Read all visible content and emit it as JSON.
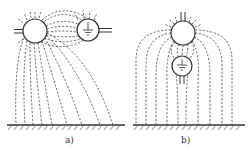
{
  "figure": {
    "panels": [
      {
        "label": "a)",
        "description": "Horizontal arrangement: energized conductor (left) beside grounded conductor (right) above earth plane; dashed field lines",
        "energized_conductor": {
          "cx": 35,
          "cy": 31,
          "r": 12
        },
        "grounded_conductor": {
          "cx": 88,
          "cy": 30,
          "r": 11,
          "icon": "ground-icon"
        },
        "ground_plane_y": 125
      },
      {
        "label": "b)",
        "description": "Vertical arrangement: energized conductor (top) above grounded conductor (bottom) above earth plane; dashed field lines",
        "energized_conductor": {
          "cx": 183,
          "cy": 33,
          "r": 12
        },
        "grounded_conductor": {
          "cx": 182,
          "cy": 66,
          "r": 10,
          "icon": "ground-icon"
        },
        "ground_plane_y": 125
      }
    ],
    "colors": {
      "line": "#333333",
      "background": "#ffffff"
    }
  }
}
